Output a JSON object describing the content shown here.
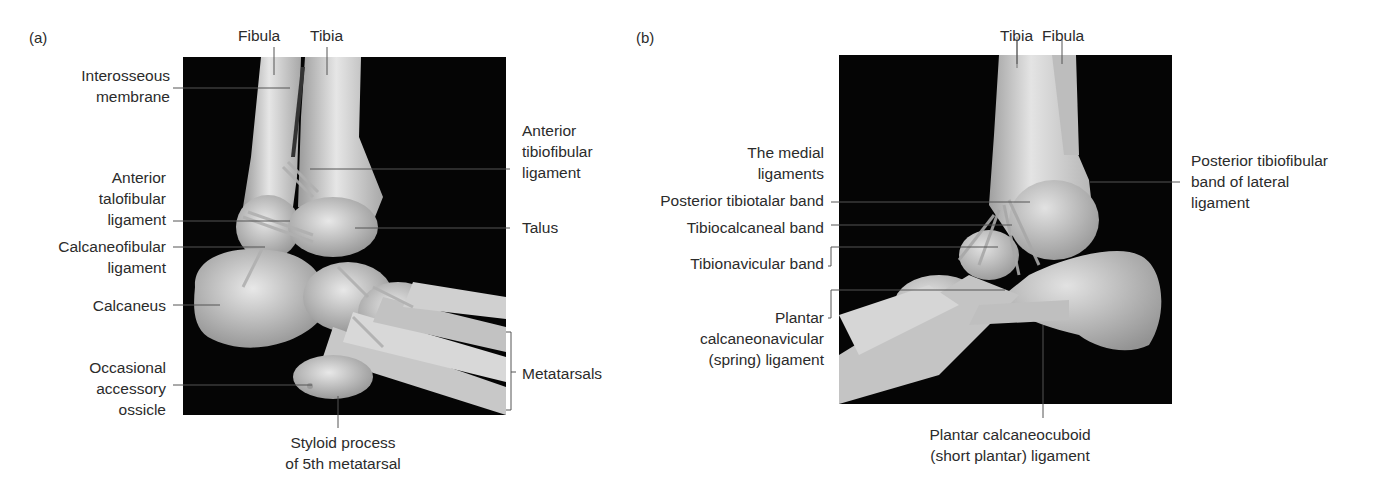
{
  "figure": {
    "panels": [
      {
        "letter": "(a)",
        "view": "lateral view of ankle",
        "labels": {
          "fibula": "Fibula",
          "tibia": "Tibia",
          "interosseous_membrane": [
            "Interosseous",
            "membrane"
          ],
          "anterior_tibiofibular_ligament": [
            "Anterior",
            "tibiofibular",
            "ligament"
          ],
          "anterior_talofibular_ligament": [
            "Anterior",
            "talofibular",
            "ligament"
          ],
          "talus": "Talus",
          "calcaneofibular_ligament": [
            "Calcaneofibular",
            "ligament"
          ],
          "calcaneus": "Calcaneus",
          "metatarsals": "Metatarsals",
          "occasional_accessory_ossicle": [
            "Occasional",
            "accessory",
            "ossicle"
          ],
          "styloid_process": [
            "Styloid process",
            "of 5th metatarsal"
          ]
        }
      },
      {
        "letter": "(b)",
        "view": "medial view of ankle",
        "labels": {
          "tibia": "Tibia",
          "fibula": "Fibula",
          "medial_ligaments": [
            "The medial",
            "ligaments"
          ],
          "posterior_tibiotalar_band": "Posterior tibiotalar band",
          "tibiocalcaneal_band": "Tibiocalcaneal band",
          "tibionavicular_band": "Tibionavicular band",
          "plantar_calcaneonavicular": [
            "Plantar",
            "calcaneonavicular",
            "(spring) ligament"
          ],
          "posterior_tibiofibular_band": [
            "Posterior tibiofibular",
            "band of lateral",
            "ligament"
          ],
          "plantar_calcaneocuboid": [
            "Plantar calcaneocuboid",
            "(short plantar) ligament"
          ]
        }
      }
    ],
    "colors": {
      "background": "#ffffff",
      "photo_background": "#050505",
      "bone": "#d9d9d9",
      "leader_line": "#555555",
      "text": "#2b2b2b"
    }
  }
}
